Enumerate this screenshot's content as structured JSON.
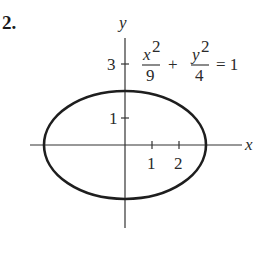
{
  "problem": {
    "number": "2."
  },
  "axes": {
    "x_label": "x",
    "y_label": "y",
    "x_ticks": [
      {
        "value": 1,
        "label": "1"
      },
      {
        "value": 2,
        "label": "2"
      }
    ],
    "y_ticks": [
      {
        "value": 1,
        "label": "1"
      },
      {
        "value": 3,
        "label": "3"
      }
    ]
  },
  "equation": {
    "term1_num_var": "x",
    "term1_num_exp": "2",
    "term1_den": "9",
    "plus": "+",
    "term2_num_var": "y",
    "term2_num_exp": "2",
    "term2_den": "4",
    "equals": "= 1"
  },
  "curve": {
    "type": "ellipse",
    "center": [
      0,
      0
    ],
    "semi_major_x": 3,
    "semi_minor_y": 2,
    "stroke_color": "#1e1e1e"
  },
  "colors": {
    "background": "#ffffff",
    "ink": "#2a2a2a"
  }
}
